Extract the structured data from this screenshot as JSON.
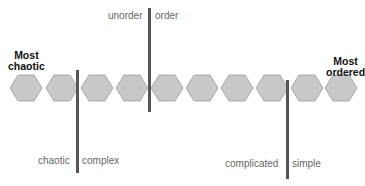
{
  "end_labels": {
    "left": {
      "line1": "Most",
      "line2": "chaotic"
    },
    "right": {
      "line1": "Most",
      "line2": "ordered"
    }
  },
  "dividers": [
    {
      "left_label": "unorder",
      "right_label": "order"
    },
    {
      "left_label": "chaotic",
      "right_label": "complex"
    },
    {
      "left_label": "complicated",
      "right_label": "simple"
    }
  ],
  "hexagon_count": 10,
  "colors": {
    "hexagon_fill": "#c8c8c8",
    "hexagon_stroke": "#9a9a9a",
    "divider": "#555555",
    "label": "#666666"
  }
}
